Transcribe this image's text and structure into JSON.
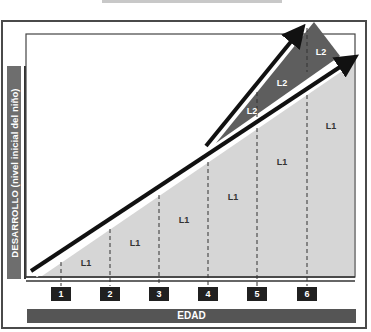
{
  "diagram": {
    "y_axis_label": "DESARROLLO (nivel inicial del niño)",
    "x_axis_label": "EDAD",
    "x_ticks": [
      "1",
      "2",
      "3",
      "4",
      "5",
      "6"
    ],
    "l1_labels": [
      "L1",
      "L1",
      "L1",
      "L1",
      "L1",
      "L1"
    ],
    "l2_labels": [
      "L2",
      "L2",
      "L2"
    ],
    "colors": {
      "l1_fill": "#d6d6d6",
      "l2_fill": "#5e5e5e",
      "arrow": "#111111",
      "axis_band": "#6e6e6e",
      "tick_box": "#202020",
      "xlabel_bar": "#555555"
    }
  }
}
